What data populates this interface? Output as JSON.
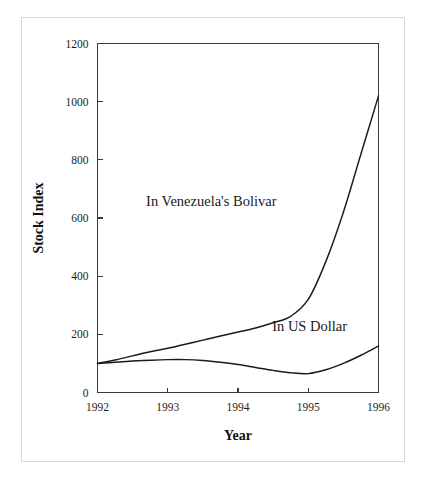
{
  "figure": {
    "background_color": "#ffffff",
    "frame_color": "#d8d8d8",
    "line_color": "#1a1a1a"
  },
  "chart_data": {
    "type": "line",
    "title": "",
    "xlabel": "Year",
    "ylabel": "Stock Index",
    "xlim": [
      1992,
      1996
    ],
    "ylim": [
      0,
      1200
    ],
    "xticks": [
      1992,
      1993,
      1994,
      1995,
      1996
    ],
    "xticklabels": [
      "1992",
      "1993",
      "1994",
      "1995",
      "1996"
    ],
    "yticks": [
      0,
      200,
      400,
      600,
      800,
      1000,
      1200
    ],
    "yticklabels": [
      "0",
      "200",
      "400",
      "600",
      "800",
      "1000",
      "1200"
    ],
    "grid": false,
    "legend_position": "inline-annotations",
    "series": [
      {
        "name": "In Venezuela's Bolivar",
        "color": "#1a1a1a",
        "annotation": {
          "text": "In Venezuela's Bolivar",
          "x": 1993.62,
          "y": 640
        },
        "x": [
          1992.0,
          1992.25,
          1992.5,
          1992.75,
          1993.0,
          1993.25,
          1993.5,
          1993.75,
          1994.0,
          1994.25,
          1994.5,
          1994.75,
          1995.0,
          1995.25,
          1995.5,
          1995.75,
          1996.0
        ],
        "y": [
          100,
          112,
          126,
          140,
          152,
          166,
          180,
          194,
          208,
          222,
          240,
          262,
          320,
          450,
          620,
          820,
          1020
        ]
      },
      {
        "name": "In US Dollar",
        "color": "#1a1a1a",
        "annotation": {
          "text": "In US Dollar",
          "x": 1995.02,
          "y": 210
        },
        "x": [
          1992.0,
          1992.25,
          1992.5,
          1992.75,
          1993.0,
          1993.25,
          1993.5,
          1993.75,
          1994.0,
          1994.25,
          1994.5,
          1994.75,
          1995.0,
          1995.25,
          1995.5,
          1995.75,
          1996.0
        ],
        "y": [
          100,
          104,
          108,
          111,
          113,
          113,
          110,
          104,
          96,
          86,
          76,
          68,
          65,
          78,
          100,
          128,
          160
        ]
      }
    ]
  }
}
